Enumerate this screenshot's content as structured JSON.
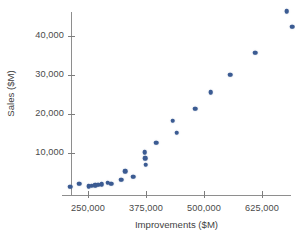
{
  "chart_data": {
    "type": "scatter",
    "title": "",
    "xlabel": "Improvements ($M)",
    "ylabel": "Sales ($M)",
    "xlim": [
      175000,
      730000
    ],
    "ylim": [
      0,
      49000
    ],
    "grid": false,
    "legend": null,
    "xticks": [
      250000,
      375000,
      500000,
      625000
    ],
    "xtick_labels": [
      "250,000",
      "375,000",
      "500,000",
      "625,000"
    ],
    "yticks": [
      10000,
      20000,
      30000,
      40000
    ],
    "ytick_labels": [
      "10,000",
      "20,000",
      "30,000",
      "40,000"
    ],
    "marker_color": "#3b5b92",
    "axis_color": "#8e8e8e",
    "points": [
      {
        "x": 212000,
        "y": 1300
      },
      {
        "x": 231000,
        "y": 2100
      },
      {
        "x": 252000,
        "y": 1500
      },
      {
        "x": 258000,
        "y": 1600
      },
      {
        "x": 265000,
        "y": 1700
      },
      {
        "x": 272000,
        "y": 1900
      },
      {
        "x": 279000,
        "y": 2000
      },
      {
        "x": 292000,
        "y": 2400
      },
      {
        "x": 300000,
        "y": 2100
      },
      {
        "x": 322000,
        "y": 3100
      },
      {
        "x": 330000,
        "y": 5300
      },
      {
        "x": 347000,
        "y": 3900
      },
      {
        "x": 372000,
        "y": 10200
      },
      {
        "x": 373000,
        "y": 8700
      },
      {
        "x": 374000,
        "y": 7000
      },
      {
        "x": 397000,
        "y": 12600
      },
      {
        "x": 433000,
        "y": 18300
      },
      {
        "x": 441000,
        "y": 15200
      },
      {
        "x": 481000,
        "y": 21400
      },
      {
        "x": 514000,
        "y": 25600
      },
      {
        "x": 556000,
        "y": 30100
      },
      {
        "x": 610000,
        "y": 35700
      },
      {
        "x": 678000,
        "y": 46400
      },
      {
        "x": 690000,
        "y": 42400
      }
    ]
  }
}
